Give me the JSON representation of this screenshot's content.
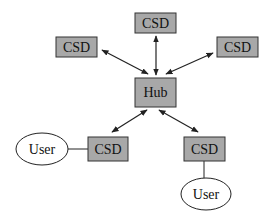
{
  "diagram": {
    "type": "hub-and-spoke network",
    "colors": {
      "box_fill": "#a8a8a8",
      "box_stroke": "#333333",
      "ellipse_fill": "#ffffff",
      "line": "#222222",
      "background": "#ffffff"
    },
    "nodes": {
      "csd_top": {
        "label": "CSD"
      },
      "csd_left": {
        "label": "CSD"
      },
      "csd_right": {
        "label": "CSD"
      },
      "hub": {
        "label": "Hub"
      },
      "csd_bottom_left": {
        "label": "CSD"
      },
      "csd_bottom_right": {
        "label": "CSD"
      },
      "user_left": {
        "label": "User"
      },
      "user_bottom": {
        "label": "User"
      }
    },
    "edges": [
      {
        "from": "hub",
        "to": "csd_top",
        "style": "bidirectional-arrow"
      },
      {
        "from": "hub",
        "to": "csd_left",
        "style": "bidirectional-arrow"
      },
      {
        "from": "hub",
        "to": "csd_right",
        "style": "bidirectional-arrow"
      },
      {
        "from": "hub",
        "to": "csd_bottom_left",
        "style": "bidirectional-arrow"
      },
      {
        "from": "hub",
        "to": "csd_bottom_right",
        "style": "bidirectional-arrow"
      },
      {
        "from": "user_left",
        "to": "csd_bottom_left",
        "style": "line"
      },
      {
        "from": "csd_bottom_right",
        "to": "user_bottom",
        "style": "line"
      }
    ]
  }
}
